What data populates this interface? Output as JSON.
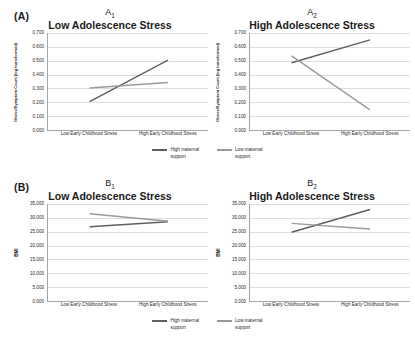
{
  "figure": {
    "panels": [
      {
        "letter": "(A)",
        "charts": [
          {
            "sub_main": "A",
            "sub_index": "1",
            "title": "Low Adolescence Stress"
          },
          {
            "sub_main": "A",
            "sub_index": "2",
            "title": "High Adolescence Stress"
          }
        ],
        "legend": [
          {
            "label": "High maternal\nsupport",
            "color": "#5f5f5f"
          },
          {
            "label": "Low maternal\nsupport",
            "color": "#9a9a9a"
          }
        ]
      },
      {
        "letter": "(B)",
        "charts": [
          {
            "sub_main": "B",
            "sub_index": "1",
            "title": "Low Adolescence Stress"
          },
          {
            "sub_main": "B",
            "sub_index": "2",
            "title": "High Adolescence Stress"
          }
        ],
        "legend": [
          {
            "label": "High maternal\nsupport",
            "color": "#5f5f5f"
          },
          {
            "label": "Low maternal\nsupport",
            "color": "#9a9a9a"
          }
        ]
      }
    ]
  },
  "chart_data": [
    {
      "type": "line",
      "id": "A1",
      "title": "Low Adolescence Stress",
      "panel_label": "A1",
      "xlabel": "",
      "ylabel": "Illness/Symptom Count (log transformed)",
      "categories": [
        "Low Early Childhood Stress",
        "High Early Childhood Stress"
      ],
      "ylim": [
        0.0,
        0.7
      ],
      "yticks": [
        0.0,
        0.1,
        0.2,
        0.3,
        0.4,
        0.5,
        0.6,
        0.7
      ],
      "ytick_labels": [
        "0.000",
        "0.100",
        "0.200",
        "0.300",
        "0.400",
        "0.500",
        "0.600",
        "0.700"
      ],
      "grid": true,
      "legend_position": "bottom",
      "series": [
        {
          "name": "High maternal support",
          "color": "#5f5f5f",
          "values": [
            0.205,
            0.505
          ]
        },
        {
          "name": "Low maternal support",
          "color": "#9a9a9a",
          "values": [
            0.303,
            0.343
          ]
        }
      ]
    },
    {
      "type": "line",
      "id": "A2",
      "title": "High Adolescence Stress",
      "panel_label": "A2",
      "xlabel": "",
      "ylabel": "Illness/Symptom Count (log transformed)",
      "categories": [
        "Low Early Childhood Stress",
        "High Early Childhood Stress"
      ],
      "ylim": [
        0.0,
        0.7
      ],
      "yticks": [
        0.0,
        0.1,
        0.2,
        0.3,
        0.4,
        0.5,
        0.6,
        0.7
      ],
      "ytick_labels": [
        "0.000",
        "0.100",
        "0.200",
        "0.300",
        "0.400",
        "0.500",
        "0.600",
        "0.700"
      ],
      "grid": true,
      "legend_position": "bottom",
      "series": [
        {
          "name": "High maternal support",
          "color": "#5f5f5f",
          "values": [
            0.485,
            0.65
          ]
        },
        {
          "name": "Low maternal support",
          "color": "#9a9a9a",
          "values": [
            0.535,
            0.145
          ]
        }
      ]
    },
    {
      "type": "line",
      "id": "B1",
      "title": "Low Adolescence Stress",
      "panel_label": "B1",
      "xlabel": "",
      "ylabel": "BMI",
      "categories": [
        "Low Early Childhood Stress",
        "High Early Childhood Stress"
      ],
      "ylim": [
        0.0,
        35.0
      ],
      "yticks": [
        0.0,
        5.0,
        10.0,
        15.0,
        20.0,
        25.0,
        30.0,
        35.0
      ],
      "ytick_labels": [
        "0.000",
        "5.000",
        "10.000",
        "15.000",
        "20.000",
        "25.000",
        "30.000",
        "35.000"
      ],
      "grid": true,
      "legend_position": "bottom",
      "series": [
        {
          "name": "High maternal support",
          "color": "#5f5f5f",
          "values": [
            26.8,
            28.6
          ]
        },
        {
          "name": "Low maternal support",
          "color": "#9a9a9a",
          "values": [
            31.5,
            28.8
          ]
        }
      ]
    },
    {
      "type": "line",
      "id": "B2",
      "title": "High Adolescence Stress",
      "panel_label": "B2",
      "xlabel": "",
      "ylabel": "BMI",
      "categories": [
        "Low Early Childhood Stress",
        "High Early Childhood Stress"
      ],
      "ylim": [
        0.0,
        35.0
      ],
      "yticks": [
        0.0,
        5.0,
        10.0,
        15.0,
        20.0,
        25.0,
        30.0,
        35.0
      ],
      "ytick_labels": [
        "0.000",
        "5.000",
        "10.000",
        "15.000",
        "20.000",
        "25.000",
        "30.000",
        "35.000"
      ],
      "grid": true,
      "legend_position": "bottom",
      "series": [
        {
          "name": "High maternal support",
          "color": "#5f5f5f",
          "values": [
            24.8,
            33.0
          ]
        },
        {
          "name": "Low maternal support",
          "color": "#9a9a9a",
          "values": [
            28.0,
            26.0
          ]
        }
      ]
    }
  ]
}
